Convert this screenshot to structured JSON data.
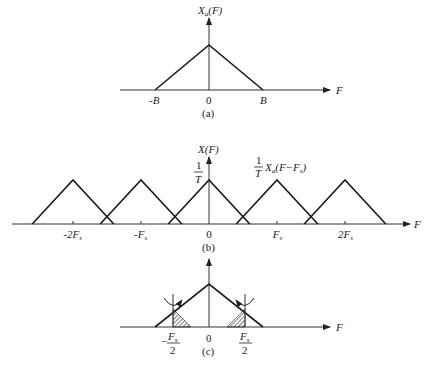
{
  "panels": [
    {
      "id": "a",
      "caption": "(a)",
      "y_label": "X_a(F)",
      "y_label_main": "X",
      "y_label_sub": "a",
      "y_label_tail": "(F)",
      "x_label": "F",
      "ticks": [
        {
          "label": "-B",
          "value": -1
        },
        {
          "label": "0",
          "value": 0
        },
        {
          "label": "B",
          "value": 1
        }
      ],
      "spectrum": {
        "shape": "triangle",
        "center": 0,
        "half_width": "B",
        "peak": 1
      }
    },
    {
      "id": "b",
      "caption": "(b)",
      "y_label": "X(F)",
      "x_label": "F",
      "peak_label": "1/T",
      "peak_label_num": "1",
      "peak_label_den": "T",
      "replica_label": "(1/T) X_a(F−F_s)",
      "replica_label_num": "1",
      "replica_label_den": "T",
      "replica_label_main": "X",
      "replica_label_sub": "a",
      "replica_label_tail": "(F−F",
      "replica_label_tail_sub": "s",
      "replica_label_close": ")",
      "ticks": [
        {
          "label": "-2F",
          "sub": "s",
          "value": -2
        },
        {
          "label": "-F",
          "sub": "s",
          "value": -1
        },
        {
          "label": "0",
          "sub": "",
          "value": 0
        },
        {
          "label": "F",
          "sub": "s",
          "value": 1
        },
        {
          "label": "2F",
          "sub": "s",
          "value": 2
        }
      ],
      "replica_centers_in_Fs": [
        -2,
        -1,
        0,
        1,
        2
      ],
      "half_width_in_Fs": 0.6
    },
    {
      "id": "c",
      "caption": "(c)",
      "x_label": "F",
      "ticks": [
        {
          "label": "−",
          "frac_num": "F",
          "frac_sub": "s",
          "frac_den": "2",
          "value": -0.5
        },
        {
          "label": "0",
          "value": 0
        },
        {
          "label": "",
          "frac_num": "F",
          "frac_sub": "s",
          "frac_den": "2",
          "value": 0.5
        }
      ],
      "annotation": "folding at ±Fs/2 with shaded aliased regions"
    }
  ]
}
